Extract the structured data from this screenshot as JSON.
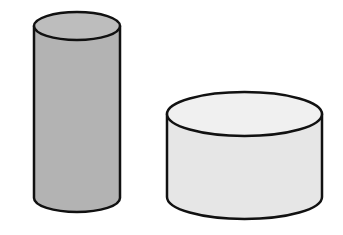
{
  "figure": {
    "description": "A line drawing of two three-dimensional cylinders on a plain white background. The left cylinder is tall and narrow with a medium gray shaded surface. The right cylinder is short and wide with a very light gray, almost white surface.",
    "background_color": "#ffffff",
    "outline_color": "#111111",
    "outline_width": 2.5,
    "canvas": {
      "width": 343,
      "height": 235
    },
    "shapes": [
      {
        "id": "left-cylinder",
        "name": "tall-narrow-cylinder",
        "type": "cylinder",
        "orientation": "upright",
        "relative_size": "tall and narrow",
        "body_color": "#b3b3b3",
        "top_face_color": "#bdbdbd",
        "geometry": {
          "center_x": 77,
          "left_x": 34,
          "right_x": 120,
          "width": 86,
          "radius_x": 43,
          "radius_y": 14,
          "top_ellipse_center_y": 26,
          "bottom_ellipse_center_y": 198,
          "body_height": 172,
          "overall_top_y": 12,
          "overall_bottom_y": 212
        }
      },
      {
        "id": "right-cylinder",
        "name": "short-wide-cylinder",
        "type": "cylinder",
        "orientation": "upright",
        "relative_size": "short and wide",
        "body_color": "#e6e6e6",
        "top_face_color": "#f0f0f0",
        "geometry": {
          "center_x": 244.5,
          "left_x": 167,
          "right_x": 322,
          "width": 155,
          "radius_x": 77.5,
          "radius_y": 22,
          "top_ellipse_center_y": 114,
          "bottom_ellipse_center_y": 197,
          "body_height": 83,
          "overall_top_y": 92,
          "overall_bottom_y": 219
        }
      }
    ]
  }
}
